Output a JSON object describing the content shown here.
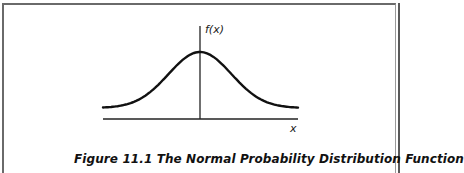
{
  "figure": {
    "y_axis_label": "f(x)",
    "x_axis_label": "x",
    "caption": "Figure 11.1  The Normal Probability Distribution Function",
    "line_color": "#111111",
    "frame_color": "#6a6a6a"
  },
  "chart_data": {
    "type": "line",
    "title": "The Normal Probability Distribution Function",
    "xlabel": "x",
    "ylabel": "f(x)",
    "grid": false,
    "series": [
      {
        "name": "f(x)",
        "shape": "normal-density",
        "mean": 0,
        "std": 1
      }
    ]
  }
}
